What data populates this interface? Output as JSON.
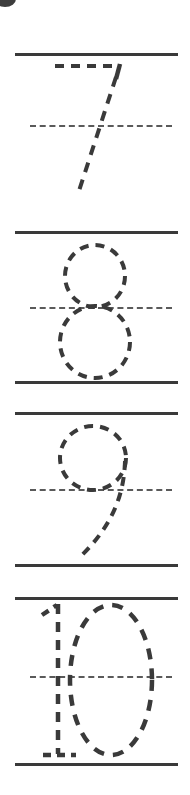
{
  "worksheet": {
    "title": "Number tracing practice worksheet",
    "type": "handwriting-tracing",
    "background_color": "#ffffff",
    "ink_color": "#3a3a3a",
    "guide_color": "#5a5a5a",
    "page_width": 190,
    "page_height": 795,
    "rule_line_left": 15,
    "rule_line_right": 178,
    "mid_line_left": 30,
    "mid_line_right": 172,
    "corner_mark": {
      "name": "page-corner-smudge",
      "visible": true
    },
    "rows": [
      {
        "id": "row-seven",
        "number": "7",
        "label": "seven",
        "top_line_y": 53,
        "mid_line_y": 125,
        "bottom_line_y": 200,
        "stroke_width": 4,
        "dash_pattern": "9 7"
      },
      {
        "id": "row-eight",
        "number": "8",
        "label": "eight",
        "top_line_y": 231,
        "mid_line_y": 307,
        "bottom_line_y": 381,
        "stroke_width": 4,
        "dash_pattern": "9 7"
      },
      {
        "id": "row-nine",
        "number": "9",
        "label": "nine",
        "top_line_y": 412,
        "mid_line_y": 489,
        "bottom_line_y": 564,
        "stroke_width": 4,
        "dash_pattern": "9 7"
      },
      {
        "id": "row-ten",
        "number": "10",
        "label": "ten",
        "top_line_y": 597,
        "mid_line_y": 676,
        "bottom_line_y": 763,
        "stroke_width": 4,
        "dash_pattern": "9 7"
      }
    ]
  }
}
